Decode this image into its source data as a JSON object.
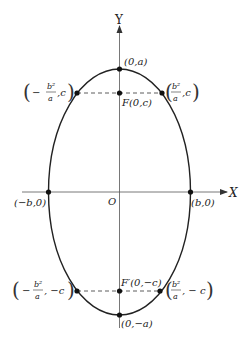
{
  "diagram": {
    "type": "ellipse-vertical-major-axis",
    "axes": {
      "x_label": "X",
      "y_label": "Y",
      "origin_label": "O"
    },
    "points": {
      "top_vertex": "(0,a)",
      "bottom_vertex": "(0,−a)",
      "left_vertex": "(−b,0)",
      "right_vertex": "(b,0)",
      "upper_focus": "F(0,c)",
      "lower_focus": "F′(0,−c)",
      "upper_left_latus": {
        "sign": "−",
        "num": "b²",
        "den": "a",
        "y": ",c"
      },
      "upper_right_latus": {
        "sign": "",
        "num": "b²",
        "den": "a",
        "y": ",c"
      },
      "lower_left_latus": {
        "sign": "−",
        "num": "b²",
        "den": "a",
        "y": ", −c"
      },
      "lower_right_latus": {
        "sign": "",
        "num": "b²",
        "den": "a",
        "y": ", − c"
      }
    },
    "colors": {
      "stroke": "#222222",
      "axis": "#444444",
      "background": "#ffffff"
    }
  }
}
